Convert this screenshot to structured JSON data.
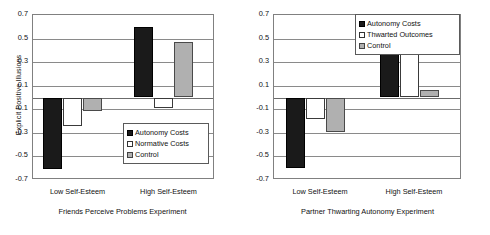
{
  "figure": {
    "panels": [
      {
        "id": "friends-perceive-problems",
        "caption": "Friends Perceive Problems Experiment",
        "ylabel": "Explicit Positive Illusions",
        "show_ylabel": true
      },
      {
        "id": "partner-thwarting-autonomy",
        "caption": "Partner Thwarting Autonomy Experiment",
        "ylabel": "",
        "show_ylabel": false
      }
    ]
  },
  "chart_data": [
    {
      "type": "bar",
      "title": "Friends Perceive Problems Experiment",
      "xlabel": "",
      "ylabel": "Explicit Positive Illusions",
      "categories": [
        "Low Self-Esteem",
        "High Self-Esteem"
      ],
      "series": [
        {
          "name": "Autonomy Costs",
          "values": [
            -0.61,
            0.6
          ],
          "color": "#1a1a1a"
        },
        {
          "name": "Normative Costs",
          "values": [
            -0.245,
            -0.085
          ],
          "color": "#ffffff"
        },
        {
          "name": "Control",
          "values": [
            -0.115,
            0.475
          ],
          "color": "#b0b0b0"
        }
      ],
      "ylim": [
        -0.7,
        0.7
      ],
      "yticks": [
        0.7,
        0.5,
        0.3,
        0.1,
        -0.1,
        -0.3,
        -0.5,
        -0.7
      ],
      "ytick_labels": [
        "0.7",
        "0.5",
        "0.3",
        "0.1",
        "-0.1",
        "-0.3",
        "-0.5",
        "-0.7"
      ],
      "grid": true,
      "legend_position": "inside-bottom-right"
    },
    {
      "type": "bar",
      "title": "Partner Thwarting Autonomy Experiment",
      "xlabel": "",
      "ylabel": "",
      "categories": [
        "Low Self-Esteem",
        "High Self-Esteem"
      ],
      "series": [
        {
          "name": "Autonomy Costs",
          "values": [
            -0.6,
            0.58
          ],
          "color": "#1a1a1a"
        },
        {
          "name": "Thwarted Outcomes",
          "values": [
            -0.185,
            0.4
          ],
          "color": "#ffffff"
        },
        {
          "name": "Control",
          "values": [
            -0.295,
            0.065
          ],
          "color": "#b0b0b0"
        }
      ],
      "ylim": [
        -0.7,
        0.7
      ],
      "yticks": [
        0.7,
        0.5,
        0.3,
        0.1,
        -0.1,
        -0.3,
        -0.5,
        -0.7
      ],
      "ytick_labels": [
        "0.7",
        "0.5",
        "0.3",
        "0.1",
        "-0.1",
        "-0.3",
        "-0.5",
        "-0.7"
      ],
      "grid": true,
      "legend_position": "inside-top-right"
    }
  ]
}
